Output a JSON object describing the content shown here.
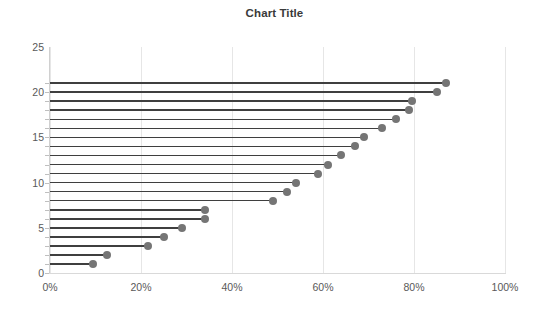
{
  "chart_data": {
    "type": "bar",
    "subtype": "lollipop-horizontal",
    "title": "Chart Title",
    "xlabel": "",
    "ylabel": "",
    "xlim": [
      0,
      100
    ],
    "ylim": [
      0,
      25
    ],
    "x_tick_labels": [
      "0%",
      "20%",
      "40%",
      "60%",
      "80%",
      "100%"
    ],
    "x_ticks": [
      0,
      20,
      40,
      60,
      80,
      100
    ],
    "y_tick_labels": [
      "0",
      "5",
      "10",
      "15",
      "20",
      "25"
    ],
    "y_ticks": [
      0,
      5,
      10,
      15,
      20,
      25
    ],
    "grid": "vertical",
    "legend": "none",
    "x_axis_format": "percent",
    "categories": [
      1,
      2,
      3,
      4,
      5,
      6,
      7,
      8,
      9,
      10,
      11,
      12,
      13,
      14,
      15,
      16,
      17,
      18,
      19,
      20,
      21
    ],
    "values": [
      9.5,
      12.5,
      21.5,
      25,
      29,
      34,
      34,
      49,
      52,
      54,
      59,
      61,
      64,
      67,
      69,
      73,
      76,
      79,
      79.6,
      85,
      87
    ],
    "series": [
      {
        "name": "Series 1",
        "values": [
          9.5,
          12.5,
          21.5,
          25,
          29,
          34,
          34,
          49,
          52,
          54,
          59,
          61,
          64,
          67,
          69,
          73,
          76,
          79,
          79.6,
          85,
          87
        ]
      }
    ],
    "colors": {
      "marker": "#757575",
      "stem": "#3f3f3f",
      "gridline": "#e6e6e6",
      "axis": "#d0d0d0",
      "title_text": "#3a3a3a",
      "tick_text": "#595959",
      "background": "#ffffff"
    }
  }
}
